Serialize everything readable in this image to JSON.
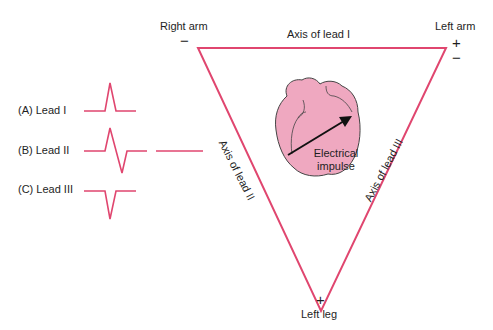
{
  "colors": {
    "accent": "#e0466f",
    "heart_fill": "#efa8c0",
    "heart_stroke": "#444444",
    "arrow": "#111111",
    "text": "#1e1e1e",
    "background": "#ffffff"
  },
  "vertices": {
    "right_arm": {
      "label": "Right arm",
      "sign": "−"
    },
    "left_arm": {
      "label": "Left arm",
      "sign_top": "+",
      "sign_bottom": "−"
    },
    "left_leg": {
      "label": "Left leg",
      "sign": "+"
    }
  },
  "axes": {
    "lead_I": "Axis of lead I",
    "lead_II": "Axis of lead II",
    "lead_III": "Axis of lead III"
  },
  "heart": {
    "arrow_label_line1": "Electrical",
    "arrow_label_line2": "impulse"
  },
  "leads": [
    {
      "label": "(A) Lead I",
      "waveform": "positive-deflection"
    },
    {
      "label": "(B) Lead II",
      "waveform": "biphasic"
    },
    {
      "label": "(C) Lead III",
      "waveform": "negative-deflection"
    }
  ]
}
